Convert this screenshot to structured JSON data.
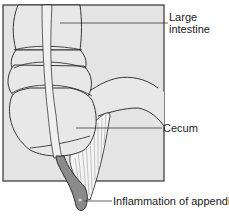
{
  "diagram": {
    "type": "anatomical illustration",
    "colors": {
      "panel_fill": "#e4e4e4",
      "panel_border": "#333333",
      "organ_fill": "#e8e8e8",
      "line": "#222222",
      "appendix_fill": "#8a8a8a",
      "mesentery_fill": "#f4f4f4"
    },
    "labels": {
      "large_intestine_line1": "Large",
      "large_intestine_line2": "intestine",
      "cecum": "Cecum",
      "appendix": "Inflammation of appendix"
    }
  }
}
